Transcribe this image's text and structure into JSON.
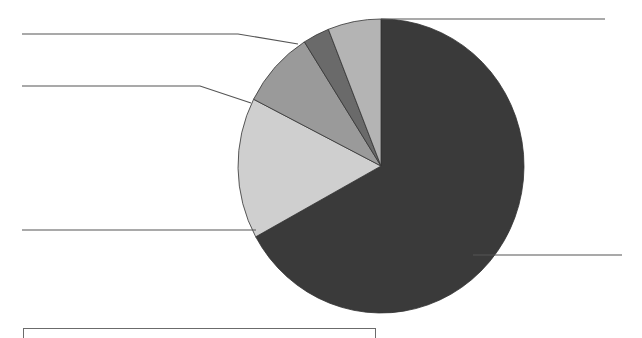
{
  "chart_data": {
    "type": "pie",
    "title": "",
    "start_angle_deg": 0,
    "direction": "clockwise",
    "slices": [
      {
        "label": "",
        "value": 67.0,
        "color": "#3a3a3a"
      },
      {
        "label": "",
        "value": 15.5,
        "color": "#cfcfcf"
      },
      {
        "label": "",
        "value": 8.5,
        "color": "#9a9a9a"
      },
      {
        "label": "",
        "value": 3.0,
        "color": "#6a6a6a"
      },
      {
        "label": "",
        "value": 6.0,
        "color": "#b4b4b4"
      }
    ],
    "leader_lines": [
      {
        "slice": 0,
        "points": [
          [
            381,
            19
          ],
          [
            605,
            19
          ]
        ]
      },
      {
        "slice": 0,
        "points": [
          [
            473,
            255
          ],
          [
            622,
            255
          ]
        ]
      },
      {
        "slice": 1,
        "points": [
          [
            22,
            230
          ],
          [
            256,
            230
          ]
        ]
      },
      {
        "slice": 2,
        "points": [
          [
            22,
            86
          ],
          [
            200,
            86
          ],
          [
            251,
            103
          ]
        ]
      },
      {
        "slice": 3,
        "points": [
          [
            22,
            34
          ],
          [
            238,
            34
          ],
          [
            298,
            44
          ]
        ]
      }
    ],
    "legend": {
      "position": "bottom",
      "entries": []
    },
    "colors": {
      "stroke": "#333333",
      "leader": "#555555"
    }
  }
}
